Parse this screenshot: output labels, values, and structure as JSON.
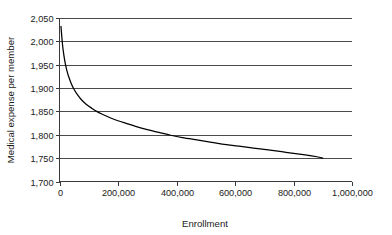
{
  "chart_data": {
    "type": "line",
    "title": "",
    "xlabel": "Enrollment",
    "ylabel": "Medical expense per member",
    "xlim": [
      0,
      1000000
    ],
    "ylim": [
      1700,
      2050
    ],
    "grid": true,
    "grid_orientation": "horizontal",
    "legend": false,
    "legend_position": "none",
    "x_ticks": [
      0,
      200000,
      400000,
      600000,
      800000,
      1000000
    ],
    "x_tick_labels": [
      "0",
      "200,000",
      "400,000",
      "600,000",
      "800,000",
      "1,000,000"
    ],
    "y_ticks": [
      1700,
      1750,
      1800,
      1850,
      1900,
      1950,
      2000,
      2050
    ],
    "y_tick_labels": [
      "1,700",
      "1,750",
      "1,800",
      "1,850",
      "1,900",
      "1,950",
      "2,000",
      "2,050"
    ],
    "series": [
      {
        "name": "Medical expense per member",
        "color": "#000000",
        "x": [
          5000,
          10000,
          15000,
          20000,
          25000,
          30000,
          40000,
          50000,
          60000,
          75000,
          90000,
          110000,
          130000,
          150000,
          175000,
          200000,
          230000,
          260000,
          300000,
          340000,
          380000,
          420000,
          470000,
          520000,
          570000,
          620000,
          670000,
          720000,
          780000,
          840000,
          880000,
          900000
        ],
        "y": [
          2032,
          1995,
          1970,
          1952,
          1938,
          1927,
          1910,
          1897,
          1887,
          1875,
          1866,
          1857,
          1849,
          1843,
          1836,
          1830,
          1824,
          1818,
          1811,
          1805,
          1799,
          1794,
          1789,
          1784,
          1779,
          1775,
          1771,
          1767,
          1762,
          1757,
          1753,
          1750
        ]
      }
    ]
  },
  "axes": {
    "y_title": "Medical expense per member",
    "x_title": "Enrollment"
  }
}
